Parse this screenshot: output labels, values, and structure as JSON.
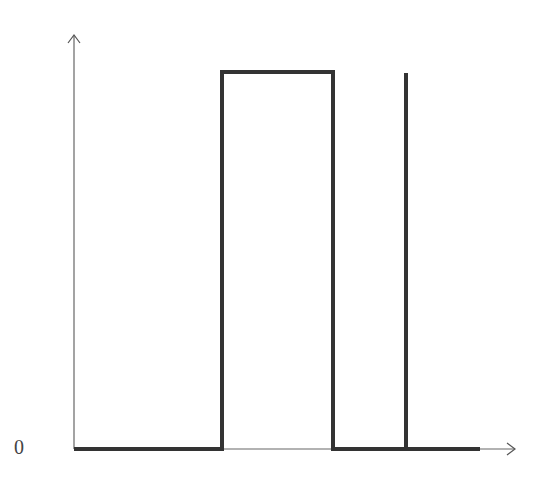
{
  "diagram": {
    "type": "signal-waveform",
    "y_axis_label": "0",
    "colors": {
      "axis": "#555555",
      "signal": "#333333",
      "background": "#ffffff"
    },
    "axis": {
      "origin": [
        74,
        449
      ],
      "x_end": 516,
      "y_top": 60
    },
    "signal_points": [
      [
        74,
        449
      ],
      [
        222,
        449
      ],
      [
        222,
        72
      ],
      [
        333,
        72
      ],
      [
        333,
        449
      ],
      [
        406,
        449
      ],
      [
        406,
        73
      ],
      [
        406,
        449
      ],
      [
        480,
        449
      ]
    ]
  },
  "chart_data": {
    "type": "line",
    "title": "",
    "xlabel": "",
    "ylabel": "",
    "tick_labels": {
      "y": [
        "0"
      ]
    },
    "grid": false,
    "series": [
      {
        "name": "rectangular pulse + impulse",
        "x": [
          0,
          0.33,
          0.33,
          0.58,
          0.58,
          0.75,
          0.75,
          0.75,
          0.92
        ],
        "y": [
          0,
          0,
          1,
          1,
          0,
          0,
          1,
          0,
          0
        ]
      }
    ]
  }
}
